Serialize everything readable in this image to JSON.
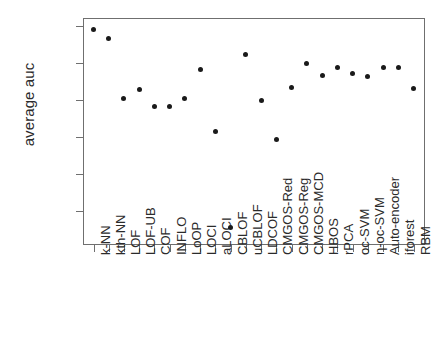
{
  "axes": {
    "ylabel": "average auc",
    "xlabel": "",
    "ytick_labels": [
      "0.85",
      "0.80",
      "0.75",
      "0.70",
      "0.65",
      "0.60"
    ],
    "ytick_values": [
      0.85,
      0.8,
      0.75,
      0.7,
      0.65,
      0.6
    ]
  },
  "style": {
    "point_color": "#1a1a1a",
    "axis_color": "#6f6f6f",
    "background": "#ffffff"
  },
  "chart_data": {
    "type": "scatter",
    "title": "",
    "xlabel": "",
    "ylabel": "average auc",
    "ylim": [
      0.558,
      0.862
    ],
    "grid": false,
    "legend": false,
    "categories": [
      "k-NN",
      "kth-NN",
      "LOF",
      "LOF-UB",
      "COF",
      "INFLO",
      "LoOP",
      "LOCI",
      "aLOCI",
      "CBLOF",
      "uCBLOF",
      "LDCOF",
      "CMGOS-Red",
      "CMGOS-Reg",
      "CMGOS-MCD",
      "HBOS",
      "rPCA",
      "oc-SVM",
      "η-oc-SVM",
      "Auto-encoder",
      "iforest",
      "RBM"
    ],
    "values": [
      0.845,
      0.833,
      0.752,
      0.763,
      0.74,
      0.74,
      0.751,
      0.79,
      0.707,
      0.577,
      0.811,
      0.748,
      0.696,
      0.766,
      0.798,
      0.782,
      0.793,
      0.785,
      0.781,
      0.793,
      0.793,
      0.765
    ]
  }
}
